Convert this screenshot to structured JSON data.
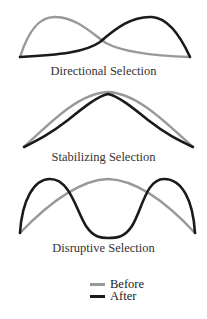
{
  "colors": {
    "before": "#999999",
    "after": "#1a1a1a"
  },
  "panels": [
    {
      "id": "directional",
      "caption": "Directional Selection",
      "before_path": "M20,57 C30,26 42,16 56,17 C78,18 92,34 106,43 C124,53 160,56 190,57",
      "after_path": "M20,57 C60,55 86,52 100,42 C116,28 132,16 152,17 C168,18 180,35 190,57"
    },
    {
      "id": "stabilizing",
      "caption": "Stabilizing Selection",
      "before_path": "M24,147 C48,125 78,93 108,92 C138,93 168,125 193,147",
      "after_path": "M24,147 C38,140 50,134 68,120 C84,107 98,96 108,94 C118,96 132,107 148,120 C166,134 178,140 193,147"
    },
    {
      "id": "disruptive",
      "caption": "Disruptive Selection",
      "before_path": "M20,233 C46,206 78,180 108,179 C138,180 170,206 195,233",
      "after_path": "M20,233 C22,200 34,179 50,179 C70,179 76,210 86,226 C94,238 102,238 108,238 C116,238 124,238 132,226 C142,210 146,179 164,179 C182,179 193,200 195,233"
    }
  ],
  "legend": {
    "items": [
      {
        "label": "Before",
        "series": "before"
      },
      {
        "label": "After",
        "series": "after"
      }
    ]
  }
}
